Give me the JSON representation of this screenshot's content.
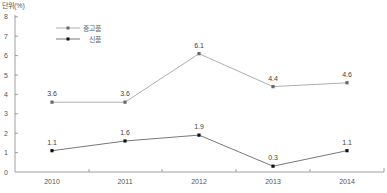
{
  "chart_data": {
    "type": "line",
    "title": "",
    "unit_label": "단위(%)",
    "xlabel": "",
    "ylabel": "단위(%)",
    "categories": [
      "2010",
      "2011",
      "2012",
      "2013",
      "2014"
    ],
    "ylim": [
      0,
      8
    ],
    "yticks": [
      0,
      1,
      2,
      3,
      4,
      5,
      6,
      7,
      8
    ],
    "grid": false,
    "legend_position": "upper-left-inside",
    "series": [
      {
        "name": "중고품",
        "color": "#999999",
        "marker_color": "#666666",
        "values": [
          3.6,
          3.6,
          6.1,
          4.4,
          4.6
        ],
        "labels": [
          "3.6",
          "3.6",
          "6.1",
          "4.4",
          "4.6"
        ]
      },
      {
        "name": "신품",
        "color": "#555555",
        "marker_color": "#111111",
        "values": [
          1.1,
          1.6,
          1.9,
          0.3,
          1.1
        ],
        "labels": [
          "1.1",
          "1.6",
          "1.9",
          "0.3",
          "1.1"
        ]
      }
    ]
  }
}
